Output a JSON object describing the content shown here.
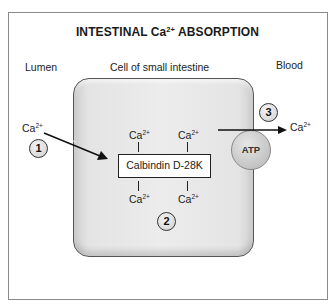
{
  "title": {
    "prefix": "INTESTINAL Ca",
    "sup": "2+",
    "suffix": " ABSORPTION"
  },
  "regions": {
    "lumen": "Lumen",
    "cell": "Cell of small intestine",
    "blood": "Blood"
  },
  "ion": {
    "base": "Ca",
    "charge": "2+"
  },
  "protein": {
    "label": "Calbindin  D-28K"
  },
  "pump": {
    "label": "ATP"
  },
  "steps": [
    "1",
    "2",
    "3"
  ],
  "colors": {
    "cell_fill": "#e6e6e6",
    "outline": "#222222",
    "frame": "#8a8a8a"
  }
}
